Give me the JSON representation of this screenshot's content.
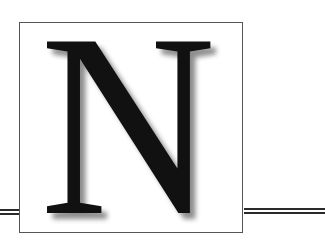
{
  "drop_cap": {
    "letter": "N"
  },
  "colors": {
    "letter": "#111111",
    "frame": "#555555",
    "rule": "#2a2a2a",
    "background": "#ffffff"
  }
}
